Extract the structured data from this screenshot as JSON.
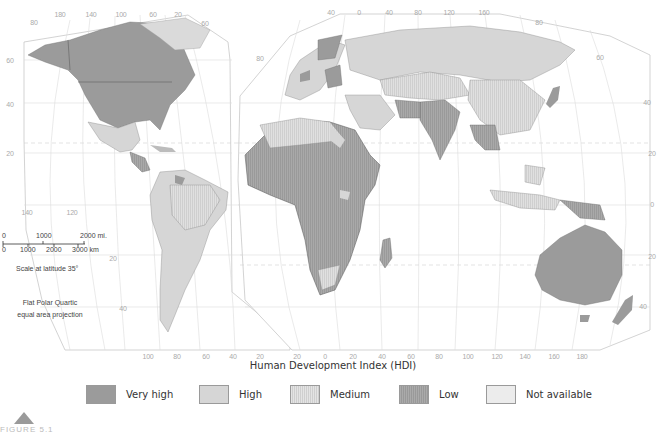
{
  "map": {
    "title": "Human Development Index (HDI)",
    "projection_line1": "Flat Polar Quartic",
    "projection_line2": "equal area projection",
    "scale": {
      "mi_labels": [
        "0",
        "1000",
        "2000 mi."
      ],
      "km_labels": [
        "0",
        "1000",
        "2000",
        "3000 km"
      ],
      "caption": "Scale at latitude 35°"
    },
    "ticks_top_left": [
      "180",
      "140",
      "100",
      "60",
      "20"
    ],
    "ticks_top_right": [
      "40",
      "0",
      "40",
      "80",
      "120",
      "160"
    ],
    "ticks_bottom_left": [
      "100",
      "80",
      "60",
      "40",
      "20"
    ],
    "ticks_bottom_right": [
      "20",
      "0",
      "20",
      "40",
      "60",
      "80",
      "100",
      "120",
      "140",
      "160",
      "180"
    ],
    "ticks_left_lat": [
      "80",
      "60",
      "40",
      "20"
    ],
    "ticks_left_lower": [
      "140",
      "120"
    ],
    "ticks_lat_right": [
      "80",
      "60",
      "40",
      "20",
      "0",
      "20",
      "40"
    ],
    "ticks_mid": [
      "60",
      "20",
      "40",
      "80",
      "40"
    ]
  },
  "legend": {
    "items": [
      {
        "label": "Very high",
        "color": "#9b9b9b",
        "pattern": "solid"
      },
      {
        "label": "High",
        "color": "#d6d6d6",
        "pattern": "solid"
      },
      {
        "label": "Medium",
        "color": "#e2e2e2",
        "pattern": "vertical-hatch"
      },
      {
        "label": "Low",
        "color": "#a8a8a8",
        "pattern": "vertical-hatch"
      },
      {
        "label": "Not available",
        "color": "#ececec",
        "pattern": "solid"
      }
    ]
  },
  "figure": {
    "label": "FIGURE 5.1"
  },
  "colors": {
    "very_high": "#9b9b9b",
    "high": "#d6d6d6",
    "medium": "#e2e2e2",
    "low": "#a8a8a8",
    "not_available": "#ececec",
    "ocean": "#ffffff",
    "graticule": "#c8c8c8",
    "border": "#555555"
  }
}
